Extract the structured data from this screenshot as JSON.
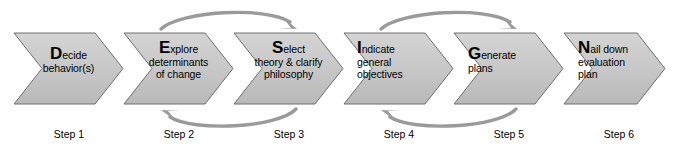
{
  "diagram": {
    "colors": {
      "chevron_fill_top": "#cfcfcf",
      "chevron_fill_bottom": "#bdbdbd",
      "chevron_stroke": "#6e6e6e",
      "arrow_color": "#9a9a9a",
      "text": "#000000",
      "background": "#ffffff"
    },
    "stages": [
      {
        "initial": "D",
        "initial_rest": "ecide",
        "lines": [
          "behavior(s)"
        ],
        "step_label": "Step 1"
      },
      {
        "initial": "E",
        "initial_rest": "xplore",
        "lines": [
          "determinants",
          "of change"
        ],
        "step_label": "Step 2"
      },
      {
        "initial": "S",
        "initial_rest": "elect",
        "lines": [
          "theory & clarify",
          "philosophy"
        ],
        "step_label": "Step 3"
      },
      {
        "initial": "I",
        "initial_rest": "ndicate",
        "lines": [
          "general",
          "objectives"
        ],
        "step_label": "Step 4"
      },
      {
        "initial": "G",
        "initial_rest": "enerate",
        "lines": [
          "plans"
        ],
        "step_label": "Step 5"
      },
      {
        "initial": "N",
        "initial_rest": "ail down",
        "lines": [
          "evaluation",
          "plan"
        ],
        "step_label": "Step 6"
      }
    ],
    "arrows": [
      {
        "name": "arrow-top-step2-to-step3",
        "direction": "forward",
        "position": "above",
        "from_step": "Step 2",
        "to_step": "Step 3"
      },
      {
        "name": "arrow-bottom-step3-to-step2",
        "direction": "backward",
        "position": "below",
        "from_step": "Step 3",
        "to_step": "Step 2"
      },
      {
        "name": "arrow-top-step4-to-step5",
        "direction": "forward",
        "position": "above",
        "from_step": "Step 4",
        "to_step": "Step 5"
      },
      {
        "name": "arrow-bottom-step5-to-step4",
        "direction": "backward",
        "position": "below",
        "from_step": "Step 5",
        "to_step": "Step 4"
      }
    ]
  }
}
